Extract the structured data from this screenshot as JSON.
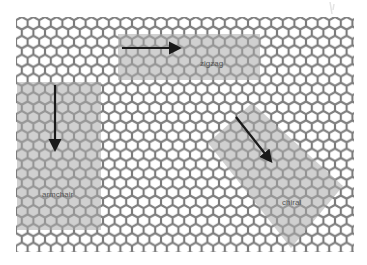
{
  "figure": {
    "lattice": {
      "x": 16,
      "y": 17,
      "width": 338,
      "height": 235,
      "hex_width": 11.6,
      "row_pitch": 9.4,
      "stroke_color": "#7a7a7a",
      "fill_color": "#ffffff"
    },
    "regions": [
      {
        "id": "zigzag",
        "label": "zigzag",
        "shape": "rect",
        "x": 118,
        "y": 34,
        "width": 142,
        "height": 46,
        "fill": "#b8b8b8",
        "arrow": {
          "x1": 122,
          "y1": 48,
          "x2": 182,
          "y2": 48,
          "direction": "right"
        },
        "label_pos": {
          "x": 200,
          "y": 66
        }
      },
      {
        "id": "armchair",
        "label": "armchair",
        "shape": "rect",
        "x": 17,
        "y": 82,
        "width": 84,
        "height": 148,
        "fill": "#b8b8b8",
        "arrow": {
          "x1": 55,
          "y1": 85,
          "x2": 55,
          "y2": 152,
          "direction": "down"
        },
        "label_pos": {
          "x": 42,
          "y": 197
        }
      },
      {
        "id": "chiral",
        "label": "chiral",
        "shape": "polygon",
        "points": "252,103 343,186 291,248 208,143",
        "fill": "#b8b8b8",
        "arrow": {
          "x1": 236,
          "y1": 117,
          "x2": 273,
          "y2": 164,
          "direction": "down-right"
        },
        "label_pos": {
          "x": 282,
          "y": 205
        }
      }
    ],
    "arrow_color": "#1a1a1a"
  }
}
